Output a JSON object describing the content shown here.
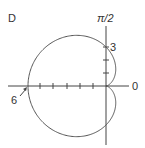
{
  "figure": {
    "label": "D",
    "axis_top_label": "π/2",
    "axis_right_label": "0",
    "tick_label_3": "3",
    "tick_label_6": "6"
  },
  "chart_data": {
    "type": "polar-curve",
    "title": "D",
    "equation": "r = 3 - 3cos(θ)",
    "labels": {
      "theta_pi_over_2": "π/2",
      "theta_0": "0",
      "r_marks": [
        "3",
        "6"
      ]
    },
    "key_points": [
      {
        "theta": "0",
        "r": 0
      },
      {
        "theta": "π/2",
        "r": 3
      },
      {
        "theta": "π",
        "r": 6
      },
      {
        "theta": "3π/2",
        "r": 3
      }
    ],
    "ticks": {
      "horizontal_negative": [
        1,
        2,
        3,
        4,
        5,
        6
      ],
      "vertical_positive": [
        1,
        2,
        3
      ]
    }
  }
}
